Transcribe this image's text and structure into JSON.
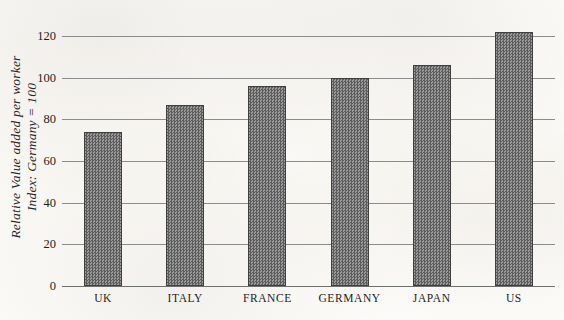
{
  "chart_data": {
    "type": "bar",
    "title": "",
    "subtitle": "",
    "xlabel": "",
    "ylabel": "Relative Value added per worker Index: Germany = 100",
    "ylabel_lines": [
      "Relative Value added per worker",
      "Index: Germany = 100"
    ],
    "categories": [
      "UK",
      "ITALY",
      "FRANCE",
      "GERMANY",
      "JAPAN",
      "US"
    ],
    "values": [
      74,
      87,
      96,
      100,
      106,
      122
    ],
    "ylim": [
      0,
      130
    ],
    "yticks": [
      0,
      20,
      40,
      60,
      80,
      100,
      120
    ],
    "ytick_labels": [
      "0",
      "20",
      "40",
      "60",
      "80",
      "100",
      "120"
    ],
    "grid": true,
    "grid_axis": "y",
    "legend": false,
    "legend_position": "none",
    "bar_color": "#7a7a7a",
    "bar_edge_color": "#3f3f3f",
    "gridline_color": "#8c8c8c",
    "background_color": "#fbfaf7"
  }
}
